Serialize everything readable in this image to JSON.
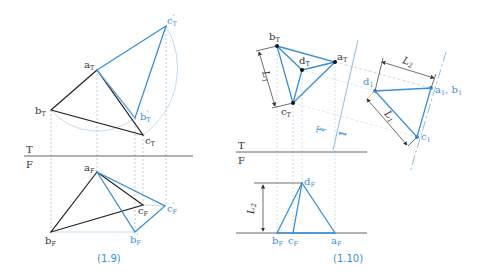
{
  "colors": {
    "black_line": "#222222",
    "blue_line": "#3a8fd4",
    "light_blue": "#b7d3ea",
    "projection": "#9aa4ad",
    "caption": "#3a8fd4"
  },
  "figures": [
    {
      "caption": "(1.9)",
      "fold_line": {
        "top_label": "T",
        "bottom_label": "F"
      },
      "points": {
        "aT": {
          "base": "a",
          "sub": "T"
        },
        "bT": {
          "base": "b",
          "sub": "T"
        },
        "cT": {
          "base": "c",
          "sub": "T"
        },
        "bpT": {
          "base": "b",
          "sub": "T",
          "prime": "'"
        },
        "cpT": {
          "base": "c",
          "sub": "T",
          "prime": "'"
        },
        "aF": {
          "base": "a",
          "sub": "F"
        },
        "bF": {
          "base": "b",
          "sub": "F"
        },
        "cF": {
          "base": "c",
          "sub": "F"
        },
        "bpF": {
          "base": "b",
          "sub": "F",
          "prime": "'"
        },
        "cpF": {
          "base": "c",
          "sub": "F",
          "prime": "'"
        }
      }
    },
    {
      "caption": "(1.10)",
      "fold_line": {
        "top_label": "T",
        "bottom_label": "F"
      },
      "aux_fold": {
        "left_label": "T",
        "right_label": "1"
      },
      "points": {
        "aT": {
          "base": "a",
          "sub": "T"
        },
        "bT": {
          "base": "b",
          "sub": "T"
        },
        "cT": {
          "base": "c",
          "sub": "T"
        },
        "dT": {
          "base": "d",
          "sub": "T"
        },
        "d1": {
          "base": "d",
          "sub": "1"
        },
        "a1b1": {
          "base": "a",
          "sub": "1",
          "sep": ", ",
          "base2": "b",
          "sub2": "1"
        },
        "c1": {
          "base": "c",
          "sub": "1"
        },
        "dF": {
          "base": "d",
          "sub": "F"
        },
        "bF": {
          "base": "b",
          "sub": "F"
        },
        "cF": {
          "base": "c",
          "sub": "F"
        },
        "aF": {
          "base": "a",
          "sub": "F"
        }
      },
      "dimensions": {
        "L1_top": {
          "base": "L",
          "sub": "1"
        },
        "L1_aux": {
          "base": "L",
          "sub": "1"
        },
        "L2_aux": {
          "base": "L",
          "sub": "2"
        },
        "L2_front": {
          "base": "L",
          "sub": "2"
        }
      }
    }
  ]
}
